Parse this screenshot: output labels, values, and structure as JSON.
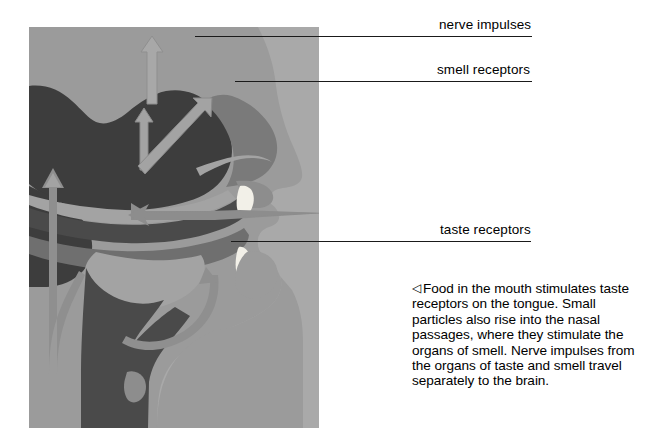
{
  "figure": {
    "background_color": "#a9a9a9",
    "palette": {
      "panel_gray": "#a9a9a9",
      "face_gray": "#9b9b9b",
      "mid_gray": "#8d8d8d",
      "dark_tissue": "#3d3d3d",
      "mid_tissue": "#6f6f6f",
      "arrow_light": "#a3a3a3",
      "arrow_mid": "#8a8a8a",
      "teeth_white": "#f2f0e8",
      "line_black": "#1a1a1a",
      "page_white": "#ffffff"
    },
    "regions": [
      {
        "name": "brain",
        "tone": "dark"
      },
      {
        "name": "nasal-cavity",
        "tone": "mid"
      },
      {
        "name": "hard-palate",
        "tone": "dark"
      },
      {
        "name": "tongue",
        "tone": "mid"
      },
      {
        "name": "teeth",
        "tone": "white"
      },
      {
        "name": "throat-pharynx",
        "tone": "dark"
      },
      {
        "name": "neck-spine",
        "tone": "dark"
      }
    ],
    "arrows": [
      {
        "name": "nerve-impulse-arrow-brain-top",
        "direction": "up"
      },
      {
        "name": "nerve-impulse-arrow-brain-inner",
        "direction": "up"
      },
      {
        "name": "smell-pathway-arrow",
        "direction": "up-right"
      },
      {
        "name": "taste-pathway-arrow-curved",
        "direction": "up-left"
      },
      {
        "name": "food-particle-arrow-mouth",
        "direction": "left"
      }
    ]
  },
  "callouts": [
    {
      "key": "nerve_impulses",
      "label": "nerve impulses",
      "line": {
        "x": 195,
        "y": 36,
        "width": 337
      },
      "text": {
        "x": 439,
        "y": 17
      }
    },
    {
      "key": "smell_receptors",
      "label": "smell receptors",
      "line": {
        "x": 235,
        "y": 81,
        "width": 297
      },
      "text": {
        "x": 437,
        "y": 62
      }
    },
    {
      "key": "taste_receptors",
      "label": "taste receptors",
      "line": {
        "x": 231,
        "y": 241,
        "width": 300
      },
      "text": {
        "x": 440,
        "y": 222
      }
    }
  ],
  "caption": {
    "marker": "◁",
    "text": "Food in the mouth stimulates taste receptors on the tongue. Small particles also rise into the nasal passages, where they stimulate the organs of smell. Nerve impulses from the organs of taste and smell travel separately to the brain.",
    "lines": [
      "Food in the mouth",
      "stimulates taste receptors on",
      "the tongue. Small particles",
      "also rise into the nasal",
      "passages, where they",
      "stimulate the organs of smell.",
      "Nerve impulses from the",
      "organs of taste and smell",
      "travel separately to the brain."
    ]
  }
}
